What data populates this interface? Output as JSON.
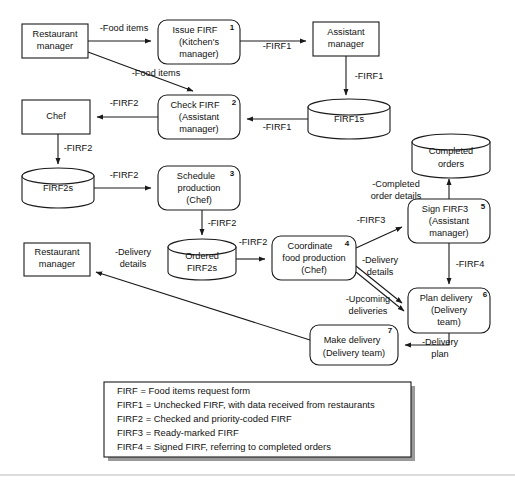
{
  "diagram": {
    "type": "data-flow-diagram",
    "nodes": [
      {
        "id": "restaurant-manager-top",
        "kind": "external-entity",
        "label_lines": [
          "Restaurant",
          "manager"
        ],
        "x": 22,
        "y": 24,
        "w": 66,
        "h": 34
      },
      {
        "id": "issue-firf",
        "kind": "process",
        "number": "1",
        "label_lines": [
          "Issue FIRF",
          "(Kitchen's",
          "manager)"
        ],
        "x": 158,
        "y": 20,
        "w": 82,
        "h": 44
      },
      {
        "id": "assistant-manager",
        "kind": "external-entity",
        "label_lines": [
          "Assistant",
          "manager"
        ],
        "x": 313,
        "y": 22,
        "w": 66,
        "h": 34
      },
      {
        "id": "check-firf",
        "kind": "process",
        "number": "2",
        "label_lines": [
          "Check FIRF",
          "(Assistant",
          "manager)"
        ],
        "x": 158,
        "y": 95,
        "w": 82,
        "h": 44
      },
      {
        "id": "firf1s",
        "kind": "data-store",
        "label_lines": [
          "FIRF1s"
        ],
        "x": 308,
        "y": 99,
        "w": 82,
        "h": 40
      },
      {
        "id": "chef",
        "kind": "external-entity",
        "label_lines": [
          "Chef"
        ],
        "x": 22,
        "y": 100,
        "w": 68,
        "h": 34
      },
      {
        "id": "firf2s",
        "kind": "data-store",
        "label_lines": [
          "FIRF2s"
        ],
        "x": 22,
        "y": 168,
        "w": 72,
        "h": 40
      },
      {
        "id": "schedule-production",
        "kind": "process",
        "number": "3",
        "label_lines": [
          "Schedule",
          "production",
          "(Chef)"
        ],
        "x": 158,
        "y": 166,
        "w": 82,
        "h": 44
      },
      {
        "id": "completed-orders",
        "kind": "data-store",
        "label_lines": [
          "Completed",
          "orders"
        ],
        "x": 412,
        "y": 134,
        "w": 78,
        "h": 44
      },
      {
        "id": "sign-firf3",
        "kind": "process",
        "number": "5",
        "label_lines": [
          "Sign FIRF3",
          "(Assistant",
          "manager)"
        ],
        "x": 408,
        "y": 199,
        "w": 82,
        "h": 44
      },
      {
        "id": "ordered-firf2s",
        "kind": "data-store",
        "label_lines": [
          "Ordered",
          "FIRF2s"
        ],
        "x": 168,
        "y": 239,
        "w": 68,
        "h": 41
      },
      {
        "id": "coordinate-food-production",
        "kind": "process",
        "number": "4",
        "label_lines": [
          "Coordinate",
          "food production",
          "(Chef)"
        ],
        "x": 272,
        "y": 236,
        "w": 84,
        "h": 44
      },
      {
        "id": "restaurant-manager-bottom",
        "kind": "external-entity",
        "label_lines": [
          "Restaurant",
          "manager"
        ],
        "x": 24,
        "y": 243,
        "w": 66,
        "h": 33
      },
      {
        "id": "plan-delivery",
        "kind": "process",
        "number": "6",
        "label_lines": [
          "Plan delivery",
          "(Delivery",
          "team)"
        ],
        "x": 408,
        "y": 288,
        "w": 82,
        "h": 45
      },
      {
        "id": "make-delivery",
        "kind": "process",
        "number": "7",
        "label_lines": [
          "Make delivery",
          "(Delivery team)"
        ],
        "x": 310,
        "y": 325,
        "w": 88,
        "h": 40
      }
    ],
    "flows": [
      {
        "id": "flow-food-items-1",
        "label": "-Food items",
        "from": "restaurant-manager-top",
        "to": "issue-firf",
        "label_x": 124,
        "label_y": 29
      },
      {
        "id": "flow-firf1-assistant",
        "label": "-FIRF1",
        "from": "issue-firf",
        "to": "assistant-manager",
        "label_x": 277,
        "label_y": 47
      },
      {
        "id": "flow-food-items-2",
        "label": "-Food items",
        "from": "restaurant-manager-top",
        "to": "check-firf",
        "label_x": 156,
        "label_y": 74
      },
      {
        "id": "flow-firf1-store",
        "label": "-FIRF1",
        "from": "assistant-manager",
        "to": "firf1s",
        "label_x": 369,
        "label_y": 77
      },
      {
        "id": "flow-firf1-check",
        "label": "-FIRF1",
        "from": "firf1s",
        "to": "check-firf",
        "label_x": 277,
        "label_y": 128
      },
      {
        "id": "flow-firf2-chef",
        "label": "-FIRF2",
        "from": "check-firf",
        "to": "chef",
        "label_x": 124,
        "label_y": 104
      },
      {
        "id": "flow-firf2-store",
        "label": "-FIRF2",
        "from": "chef",
        "to": "firf2s",
        "label_x": 78,
        "label_y": 149
      },
      {
        "id": "flow-firf2-schedule",
        "label": "-FIRF2",
        "from": "firf2s",
        "to": "schedule-production",
        "label_x": 124,
        "label_y": 176
      },
      {
        "id": "flow-firf2-ordered",
        "label": "-FIRF2",
        "from": "schedule-production",
        "to": "ordered-firf2s",
        "label_x": 222,
        "label_y": 224
      },
      {
        "id": "flow-firf2-coordinate",
        "label": "-FIRF2",
        "from": "ordered-firf2s",
        "to": "coordinate-food-production",
        "label_x": 253,
        "label_y": 243
      },
      {
        "id": "flow-firf3-sign",
        "label": "-FIRF3",
        "from": "coordinate-food-production",
        "to": "sign-firf3",
        "label_x": 371,
        "label_y": 221
      },
      {
        "id": "flow-completed-order-details",
        "label_lines": [
          "-Completed",
          "order details"
        ],
        "from": "sign-firf3",
        "to": "completed-orders",
        "label_x": 396,
        "label_y": 185
      },
      {
        "id": "flow-firf4",
        "label": "-FIRF4",
        "from": "sign-firf3",
        "to": "plan-delivery",
        "label_x": 470,
        "label_y": 265
      },
      {
        "id": "flow-delivery-details-plan",
        "label_lines": [
          "-Delivery",
          "details"
        ],
        "from": "coordinate-food-production",
        "to": "plan-delivery",
        "label_x": 380,
        "label_y": 265
      },
      {
        "id": "flow-upcoming-deliveries",
        "label_lines": [
          "-Upcoming",
          "deliveries"
        ],
        "from": "plan-delivery",
        "to": "coordinate-food-production",
        "label_x": 368,
        "label_y": 306
      },
      {
        "id": "flow-delivery-plan",
        "label_lines": [
          "-Delivery",
          "plan"
        ],
        "from": "plan-delivery",
        "to": "make-delivery",
        "label_x": 440,
        "label_y": 343
      },
      {
        "id": "flow-delivery-details-restaurant",
        "label_lines": [
          "-Delivery",
          "details"
        ],
        "from": "make-delivery",
        "to": "restaurant-manager-bottom",
        "label_x": 133,
        "label_y": 256
      }
    ]
  },
  "legend": {
    "lines": [
      "FIRF = Food items request form",
      "FIRF1 = Unchecked FIRF, with data received from restaurants",
      "FIRF2 = Checked and priority-coded FIRF",
      "FIRF3 = Ready-marked FIRF",
      "FIRF4 = Signed FIRF, referring to completed orders"
    ],
    "x": 104,
    "y": 382,
    "w": 307,
    "h": 75
  },
  "colors": {
    "line": "#1a1a1a",
    "text": "#111111",
    "background": "#ffffff",
    "legend_shadow": "#9a9a9a",
    "footer_rule": "#b9b9b9"
  }
}
